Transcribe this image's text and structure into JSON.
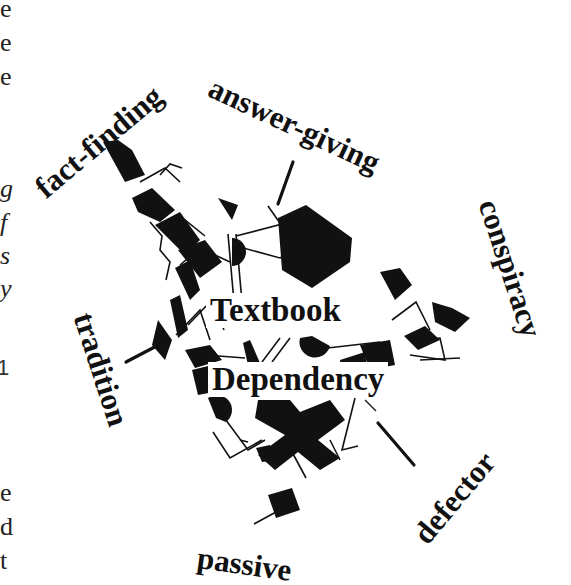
{
  "diagram": {
    "center_labels": [
      "Textbook",
      "Dependency"
    ],
    "spoke_labels": {
      "fact_finding": "fact-finding",
      "answer_giving": "answer-giving",
      "conspiracy": "conspiracy",
      "tradition": "tradition",
      "defector": "defector",
      "passive": "passive"
    }
  },
  "left_margin_fragments": [
    {
      "text": "e",
      "style": "serif"
    },
    {
      "text": "e",
      "style": "serif"
    },
    {
      "text": "e",
      "style": "serif"
    },
    {
      "text": "g",
      "style": "italic"
    },
    {
      "text": "f",
      "style": "italic"
    },
    {
      "text": "s",
      "style": "italic"
    },
    {
      "text": "y",
      "style": "italic"
    },
    {
      "text": "1",
      "style": "sans"
    },
    {
      "text": "e",
      "style": "serif"
    },
    {
      "text": "d",
      "style": "serif"
    },
    {
      "text": "t",
      "style": "serif"
    }
  ],
  "colors": {
    "ink": "#111111",
    "background": "#ffffff"
  }
}
